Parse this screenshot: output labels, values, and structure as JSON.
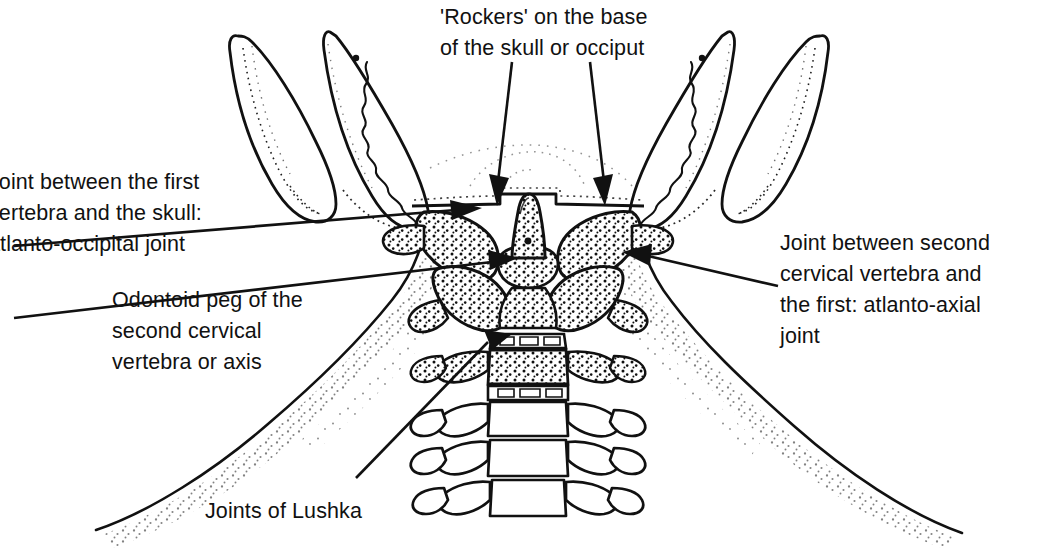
{
  "figure": {
    "type": "anatomical-line-drawing",
    "ink_color": "#111111",
    "background_color": "#ffffff"
  },
  "labels": {
    "rockers": {
      "text": "'Rockers' on the base\nof the skull or occiput",
      "lines": [
        "'Rockers' on the base",
        "of the skull or occiput"
      ],
      "position": "top-center",
      "pointer": "two-down-arrows"
    },
    "atlanto_occipital": {
      "text": "Joint between the first\nvertebra and the skull:\natlanto-occipital joint",
      "lines": [
        "Joint between the first",
        "vertebra and the skull:",
        "atlanto-occipital joint"
      ],
      "position": "left-upper",
      "pointer": "leader-line-with-arrowhead",
      "clipped_at_left_edge": true
    },
    "odontoid": {
      "text": "Odontoid peg of the\nsecond cervical\nvertebra or axis",
      "lines": [
        "Odontoid peg of the",
        "second cervical",
        "vertebra or axis"
      ],
      "position": "left-middle",
      "pointer": "leader-line-with-arrowhead"
    },
    "atlanto_axial": {
      "text": "Joint between second\ncervical vertebra and\nthe first: atlanto-axial\njoint",
      "lines": [
        "Joint between second",
        "cervical vertebra and",
        "the first: atlanto-axial",
        "joint"
      ],
      "position": "right-middle",
      "pointer": "leader-line-with-arrowhead"
    },
    "lushka": {
      "text": "Joints of Lushka",
      "lines": [
        "Joints of Lushka"
      ],
      "position": "bottom-center-left",
      "pointer": "leader-line"
    }
  },
  "anatomy": {
    "structures": [
      "mandible-ramus-left",
      "mandible-ramus-right",
      "mastoid-process-left",
      "mastoid-process-right",
      "occiput-base",
      "atlas-c1",
      "odontoid-peg",
      "axis-c2",
      "cervical-vertebra-c3",
      "cervical-vertebra-c4",
      "cervical-vertebra-c5",
      "cervical-vertebra-c6",
      "neck-soft-tissue",
      "shoulder-contour-left",
      "shoulder-contour-right"
    ],
    "shading_style": "stipple"
  }
}
